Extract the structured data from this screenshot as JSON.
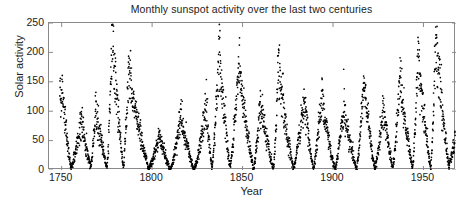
{
  "chart_data": {
    "type": "scatter",
    "title": "Monthly sunspot activity over the last two centuries",
    "xlabel": "Year",
    "ylabel": "Solar activity",
    "xlim": [
      1743,
      1968
    ],
    "ylim": [
      0,
      250
    ],
    "xticks": [
      1750,
      1800,
      1850,
      1900,
      1950
    ],
    "xtick_labels": [
      "1750",
      "1800",
      "1850",
      "1900",
      "1950"
    ],
    "yticks": [
      0,
      50,
      100,
      150,
      200,
      250
    ],
    "ytick_labels": [
      "0",
      "50",
      "100",
      "150",
      "200",
      "250"
    ],
    "grid": false,
    "legend": null,
    "marker": {
      "shape": "dot",
      "color": "#000000",
      "size_px": 1.6
    },
    "series_name": "Monthly mean sunspot number",
    "cycle_peaks": [
      {
        "year": 1750,
        "value": 158
      },
      {
        "year": 1761,
        "value": 86
      },
      {
        "year": 1769,
        "value": 106
      },
      {
        "year": 1778,
        "value": 238
      },
      {
        "year": 1787,
        "value": 174
      },
      {
        "year": 1804,
        "value": 62
      },
      {
        "year": 1816,
        "value": 96
      },
      {
        "year": 1830,
        "value": 109
      },
      {
        "year": 1837,
        "value": 206
      },
      {
        "year": 1848,
        "value": 180
      },
      {
        "year": 1860,
        "value": 116
      },
      {
        "year": 1870,
        "value": 176
      },
      {
        "year": 1884,
        "value": 127
      },
      {
        "year": 1894,
        "value": 128
      },
      {
        "year": 1906,
        "value": 108
      },
      {
        "year": 1917,
        "value": 154
      },
      {
        "year": 1928,
        "value": 105
      },
      {
        "year": 1937,
        "value": 162
      },
      {
        "year": 1947,
        "value": 201
      },
      {
        "year": 1957,
        "value": 235
      }
    ],
    "cycle_minima": [
      {
        "year": 1755,
        "value": 4
      },
      {
        "year": 1766,
        "value": 6
      },
      {
        "year": 1775,
        "value": 3
      },
      {
        "year": 1784,
        "value": 5
      },
      {
        "year": 1798,
        "value": 2
      },
      {
        "year": 1810,
        "value": 0
      },
      {
        "year": 1823,
        "value": 0
      },
      {
        "year": 1833,
        "value": 3
      },
      {
        "year": 1843,
        "value": 5
      },
      {
        "year": 1856,
        "value": 2
      },
      {
        "year": 1867,
        "value": 3
      },
      {
        "year": 1878,
        "value": 1
      },
      {
        "year": 1889,
        "value": 3
      },
      {
        "year": 1901,
        "value": 1
      },
      {
        "year": 1913,
        "value": 1
      },
      {
        "year": 1923,
        "value": 3
      },
      {
        "year": 1933,
        "value": 3
      },
      {
        "year": 1944,
        "value": 4
      },
      {
        "year": 1954,
        "value": 2
      },
      {
        "year": 1964,
        "value": 6
      }
    ]
  }
}
